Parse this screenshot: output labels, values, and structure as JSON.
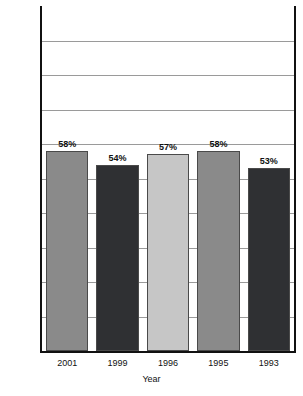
{
  "chart_data": {
    "type": "bar",
    "title": "",
    "subtitle": "",
    "xlabel": "Year",
    "ylabel": "",
    "categories": [
      "2001",
      "1999",
      "1996",
      "1995",
      "1993"
    ],
    "values": [
      58,
      54,
      57,
      58,
      53
    ],
    "value_labels": [
      "58%",
      "54%",
      "57%",
      "58%",
      "53%"
    ],
    "bar_colors": [
      "#8a8a8a",
      "#2f3033",
      "#c6c6c6",
      "#8a8a8a",
      "#2f3033"
    ],
    "ylim": [
      0,
      100
    ],
    "ytick_values": [
      0,
      10,
      20,
      30,
      40,
      50,
      60,
      70,
      80,
      90
    ],
    "ytick_labels": [
      "0%",
      "10%",
      "20%",
      "30%",
      "40%",
      "50%",
      "60%",
      "70%",
      "80%",
      "90%"
    ],
    "grid": true,
    "grid_axis": "y",
    "legend": false,
    "legend_position": "none",
    "series": [
      {
        "name": "",
        "values": [
          58,
          54,
          57,
          58,
          53
        ]
      }
    ],
    "annotations": []
  },
  "axis": {
    "x_title": "Year",
    "y_ticks": [
      {
        "label": "90%",
        "value": 90
      },
      {
        "label": "80%",
        "value": 80
      },
      {
        "label": "70%",
        "value": 70
      },
      {
        "label": "60%",
        "value": 60
      },
      {
        "label": "50%",
        "value": 50
      },
      {
        "label": "40%",
        "value": 40
      },
      {
        "label": "30%",
        "value": 30
      },
      {
        "label": "20%",
        "value": 20
      },
      {
        "label": "10%",
        "value": 10
      },
      {
        "label": "0%",
        "value": 0
      }
    ],
    "x_ticks": [
      {
        "label": "2001"
      },
      {
        "label": "1999"
      },
      {
        "label": "1996"
      },
      {
        "label": "1995"
      },
      {
        "label": "1993"
      }
    ]
  },
  "bars": [
    {
      "category": "2001",
      "value": 58,
      "label": "58%",
      "color": "#8a8a8a"
    },
    {
      "category": "1999",
      "value": 54,
      "label": "54%",
      "color": "#2f3033"
    },
    {
      "category": "1996",
      "value": 57,
      "label": "57%",
      "color": "#c6c6c6"
    },
    {
      "category": "1995",
      "value": 58,
      "label": "58%",
      "color": "#8a8a8a"
    },
    {
      "category": "1993",
      "value": 53,
      "label": "53%",
      "color": "#2f3033"
    }
  ],
  "colors": {
    "axis": "#111111",
    "gridline": "#9a9a9a",
    "background": "#ffffff",
    "bar_medium_gray": "#8a8a8a",
    "bar_dark": "#2f3033",
    "bar_light_gray": "#c6c6c6"
  }
}
